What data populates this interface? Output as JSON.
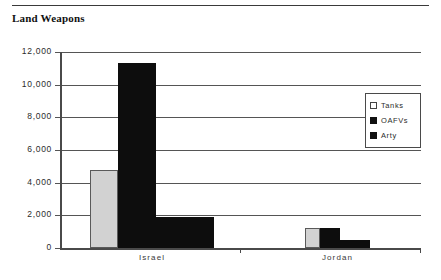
{
  "document": {
    "title": "Land Weapons",
    "rule": "horizontal-rule"
  },
  "chart_data": {
    "type": "bar",
    "title": "Land Weapons",
    "xlabel": "",
    "ylabel": "",
    "categories": [
      "Israel",
      "Jordan"
    ],
    "series": [
      {
        "name": "Tanks",
        "values": [
          4800,
          1200
        ],
        "color": "#d2d2d2"
      },
      {
        "name": "OAFVs",
        "values": [
          11300,
          1250
        ],
        "color": "#0d0d0d"
      },
      {
        "name": "Arty",
        "values": [
          1900,
          500
        ],
        "color": "#0d0d0d"
      }
    ],
    "ylim": [
      0,
      12000
    ],
    "yticks": [
      0,
      2000,
      4000,
      6000,
      8000,
      10000,
      12000
    ],
    "ytick_labels": [
      "0",
      "2,000",
      "4,000",
      "6,000",
      "8,000",
      "10,000",
      "12,000"
    ],
    "grid": true,
    "legend_position": "right"
  },
  "legend": {
    "items": [
      {
        "label": "Tanks"
      },
      {
        "label": "OAFVs"
      },
      {
        "label": "Arty"
      }
    ]
  }
}
